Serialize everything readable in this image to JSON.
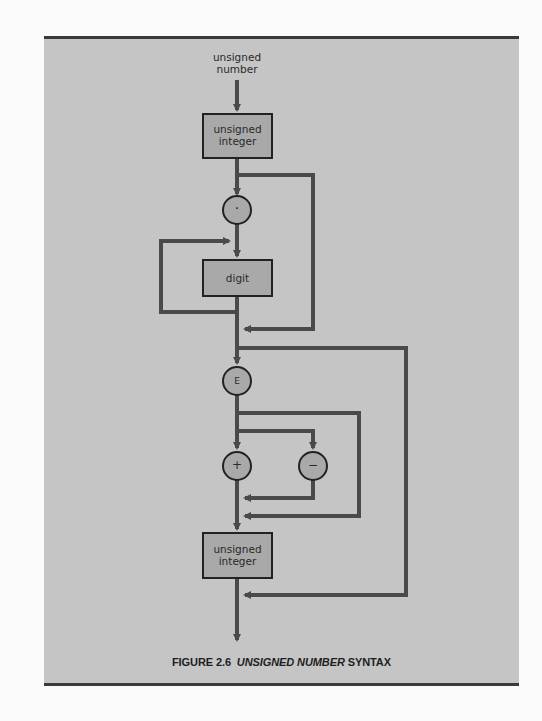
{
  "figure": {
    "entry_label_line1": "unsigned",
    "entry_label_line2": "number",
    "caption_prefix": "FIGURE 2.6",
    "caption_italic": "UNSIGNED NUMBER",
    "caption_suffix": "SYNTAX"
  },
  "nodes": {
    "box1": {
      "line1": "unsigned",
      "line2": "integer"
    },
    "dot": {
      "symbol": "·"
    },
    "digit": {
      "label": "digit"
    },
    "exponent": {
      "symbol": "E"
    },
    "plus": {
      "symbol": "+"
    },
    "minus": {
      "symbol": "−"
    },
    "box2": {
      "line1": "unsigned",
      "line2": "integer"
    }
  },
  "colors": {
    "background": "#c5c5c5",
    "node_fill": "#a9a9a9",
    "line": "#4a4a4a",
    "border": "#222222"
  }
}
